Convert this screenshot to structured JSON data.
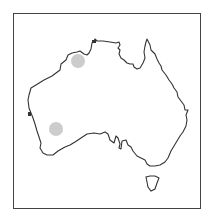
{
  "map": {
    "subject": "Australia outline",
    "border_color": "#444444",
    "coast_color": "#333333",
    "markers": [
      {
        "name": "northwest-marker",
        "cx": 78,
        "cy": 61,
        "r": 7,
        "color": "#cccccc"
      },
      {
        "name": "southwest-marker",
        "cx": 56,
        "cy": 129,
        "r": 7,
        "color": "#cccccc"
      }
    ]
  }
}
